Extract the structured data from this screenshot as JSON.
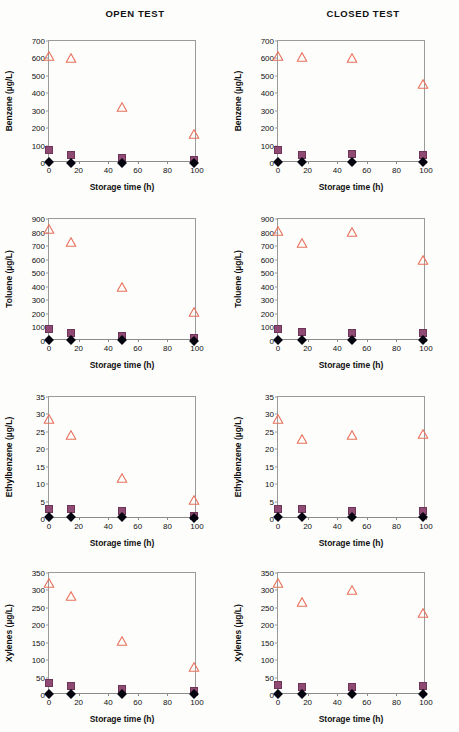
{
  "figure": {
    "column_titles": [
      "OPEN TEST",
      "CLOSED TEST"
    ],
    "xlabel": "Storage time (h)",
    "marker_colors": {
      "triangle": "#e8705a",
      "square": "#8e4a72",
      "diamond": "#050510"
    }
  },
  "chart_data": [
    {
      "id": "benzene-open",
      "type": "scatter",
      "title": "OPEN TEST",
      "xlabel": "Storage time (h)",
      "ylabel": "Benzene (µg/L)",
      "xlim": [
        0,
        100
      ],
      "ylim": [
        0,
        700
      ],
      "xticks": [
        0,
        20,
        40,
        60,
        80,
        100
      ],
      "yticks": [
        0,
        100,
        200,
        300,
        400,
        500,
        600,
        700
      ],
      "grid": false,
      "legend": "none",
      "x": [
        0,
        15,
        49,
        98
      ],
      "series": [
        {
          "name": "triangle",
          "marker": "open-triangle",
          "color": "#e8705a",
          "values": [
            613,
            600,
            320,
            165
          ]
        },
        {
          "name": "square",
          "marker": "filled-square",
          "color": "#8e4a72",
          "values": [
            73,
            47,
            28,
            17
          ]
        },
        {
          "name": "diamond",
          "marker": "filled-diamond",
          "color": "#050510",
          "values": [
            3,
            2,
            2,
            2
          ]
        }
      ]
    },
    {
      "id": "benzene-closed",
      "type": "scatter",
      "title": "CLOSED TEST",
      "xlabel": "Storage time (h)",
      "ylabel": "Benzene (µg/L)",
      "xlim": [
        0,
        100
      ],
      "ylim": [
        0,
        700
      ],
      "xticks": [
        0,
        20,
        40,
        60,
        80,
        100
      ],
      "yticks": [
        0,
        100,
        200,
        300,
        400,
        500,
        600,
        700
      ],
      "grid": false,
      "legend": "none",
      "x": [
        0,
        16,
        50,
        98
      ],
      "series": [
        {
          "name": "triangle",
          "marker": "open-triangle",
          "color": "#e8705a",
          "values": [
            615,
            610,
            602,
            452
          ]
        },
        {
          "name": "square",
          "marker": "filled-square",
          "color": "#8e4a72",
          "values": [
            72,
            48,
            50,
            47
          ]
        },
        {
          "name": "diamond",
          "marker": "filled-diamond",
          "color": "#050510",
          "values": [
            3,
            3,
            3,
            3
          ]
        }
      ]
    },
    {
      "id": "toluene-open",
      "type": "scatter",
      "title": "OPEN TEST",
      "xlabel": "Storage time (h)",
      "ylabel": "Toluene (µg/L)",
      "xlim": [
        0,
        100
      ],
      "ylim": [
        0,
        900
      ],
      "xticks": [
        0,
        20,
        40,
        60,
        80,
        100
      ],
      "yticks": [
        0,
        100,
        200,
        300,
        400,
        500,
        600,
        700,
        800,
        900
      ],
      "grid": false,
      "legend": "none",
      "x": [
        0,
        15,
        49,
        98
      ],
      "series": [
        {
          "name": "triangle",
          "marker": "open-triangle",
          "color": "#e8705a",
          "values": [
            825,
            730,
            400,
            212
          ]
        },
        {
          "name": "square",
          "marker": "filled-square",
          "color": "#8e4a72",
          "values": [
            88,
            58,
            38,
            22
          ]
        },
        {
          "name": "diamond",
          "marker": "filled-diamond",
          "color": "#050510",
          "values": [
            5,
            4,
            4,
            3
          ]
        }
      ]
    },
    {
      "id": "toluene-closed",
      "type": "scatter",
      "title": "CLOSED TEST",
      "xlabel": "Storage time (h)",
      "ylabel": "Toluene (µg/L)",
      "xlim": [
        0,
        100
      ],
      "ylim": [
        0,
        900
      ],
      "xticks": [
        0,
        20,
        40,
        60,
        80,
        100
      ],
      "yticks": [
        0,
        100,
        200,
        300,
        400,
        500,
        600,
        700,
        800,
        900
      ],
      "grid": false,
      "legend": "none",
      "x": [
        0,
        16,
        50,
        98
      ],
      "series": [
        {
          "name": "triangle",
          "marker": "open-triangle",
          "color": "#e8705a",
          "values": [
            815,
            720,
            805,
            600
          ]
        },
        {
          "name": "square",
          "marker": "filled-square",
          "color": "#8e4a72",
          "values": [
            88,
            68,
            58,
            62
          ]
        },
        {
          "name": "diamond",
          "marker": "filled-diamond",
          "color": "#050510",
          "values": [
            5,
            5,
            5,
            5
          ]
        }
      ]
    },
    {
      "id": "ethylbenzene-open",
      "type": "scatter",
      "title": "OPEN TEST",
      "xlabel": "Storage time (h)",
      "ylabel": "Ethylbenzene (µg/L)",
      "xlim": [
        0,
        100
      ],
      "ylim": [
        0,
        35
      ],
      "xticks": [
        0,
        20,
        40,
        60,
        80,
        100
      ],
      "yticks": [
        0,
        5,
        10,
        15,
        20,
        25,
        30,
        35
      ],
      "grid": false,
      "legend": "none",
      "x": [
        0,
        15,
        49,
        98
      ],
      "series": [
        {
          "name": "triangle",
          "marker": "open-triangle",
          "color": "#e8705a",
          "values": [
            28.6,
            24.2,
            11.8,
            5.4
          ]
        },
        {
          "name": "square",
          "marker": "filled-square",
          "color": "#8e4a72",
          "values": [
            2.8,
            2.9,
            2.3,
            1.0
          ]
        },
        {
          "name": "diamond",
          "marker": "filled-diamond",
          "color": "#050510",
          "values": [
            0.5,
            0.5,
            0.6,
            0.4
          ]
        }
      ]
    },
    {
      "id": "ethylbenzene-closed",
      "type": "scatter",
      "title": "CLOSED TEST",
      "xlabel": "Storage time (h)",
      "ylabel": "Ethylbenzene (µg/L)",
      "xlim": [
        0,
        100
      ],
      "ylim": [
        0,
        35
      ],
      "xticks": [
        0,
        20,
        40,
        60,
        80,
        100
      ],
      "yticks": [
        0,
        5,
        10,
        15,
        20,
        25,
        30,
        35
      ],
      "grid": false,
      "legend": "none",
      "x": [
        0,
        16,
        50,
        98
      ],
      "series": [
        {
          "name": "triangle",
          "marker": "open-triangle",
          "color": "#e8705a",
          "values": [
            28.6,
            23.0,
            24.0,
            24.3
          ]
        },
        {
          "name": "square",
          "marker": "filled-square",
          "color": "#8e4a72",
          "values": [
            2.9,
            3.0,
            2.3,
            2.4
          ]
        },
        {
          "name": "diamond",
          "marker": "filled-diamond",
          "color": "#050510",
          "values": [
            0.6,
            0.6,
            0.6,
            0.6
          ]
        }
      ]
    },
    {
      "id": "xylenes-open",
      "type": "scatter",
      "title": "OPEN TEST",
      "xlabel": "Storage time (h)",
      "ylabel": "Xylenes (µg/L)",
      "xlim": [
        0,
        100
      ],
      "ylim": [
        0,
        350
      ],
      "xticks": [
        0,
        20,
        40,
        60,
        80,
        100
      ],
      "yticks": [
        0,
        50,
        100,
        150,
        200,
        250,
        300,
        350
      ],
      "grid": false,
      "legend": "none",
      "x": [
        0,
        15,
        49,
        98
      ],
      "series": [
        {
          "name": "triangle",
          "marker": "open-triangle",
          "color": "#e8705a",
          "values": [
            322,
            283,
            155,
            80
          ]
        },
        {
          "name": "square",
          "marker": "filled-square",
          "color": "#8e4a72",
          "values": [
            33,
            25,
            18,
            11
          ]
        },
        {
          "name": "diamond",
          "marker": "filled-diamond",
          "color": "#050510",
          "values": [
            2,
            2,
            2,
            2
          ]
        }
      ]
    },
    {
      "id": "xylenes-closed",
      "type": "scatter",
      "title": "CLOSED TEST",
      "xlabel": "Storage time (h)",
      "ylabel": "Xylenes (µg/L)",
      "xlim": [
        0,
        100
      ],
      "ylim": [
        0,
        350
      ],
      "xticks": [
        0,
        20,
        40,
        60,
        80,
        100
      ],
      "yticks": [
        0,
        50,
        100,
        150,
        200,
        250,
        300,
        350
      ],
      "grid": false,
      "legend": "none",
      "x": [
        0,
        16,
        50,
        98
      ],
      "series": [
        {
          "name": "triangle",
          "marker": "open-triangle",
          "color": "#e8705a",
          "values": [
            322,
            268,
            300,
            235
          ]
        },
        {
          "name": "square",
          "marker": "filled-square",
          "color": "#8e4a72",
          "values": [
            30,
            24,
            23,
            25
          ]
        },
        {
          "name": "diamond",
          "marker": "filled-diamond",
          "color": "#050510",
          "values": [
            2,
            2,
            2,
            2
          ]
        }
      ]
    }
  ]
}
